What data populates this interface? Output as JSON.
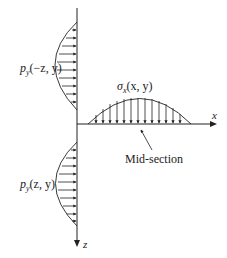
{
  "diagram": {
    "labels": {
      "top_load": "p",
      "top_load_sub": "y",
      "top_load_args": "(−z, y)",
      "bottom_load": "p",
      "bottom_load_sub": "y",
      "bottom_load_args": "(z, y)",
      "stress": "σ",
      "stress_sub": "x",
      "stress_args": "(x, y)",
      "x_axis": "x",
      "z_axis": "z",
      "mid_section": "Mid-section"
    },
    "colors": {
      "line": "#222222",
      "background": "#ffffff"
    }
  }
}
